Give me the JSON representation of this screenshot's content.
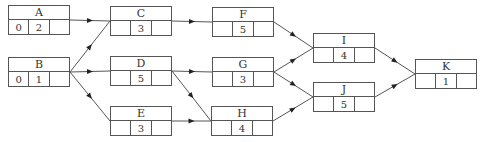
{
  "diagram": {
    "type": "activity-on-node network",
    "nodes": [
      {
        "id": "A",
        "x": 8,
        "y": 5,
        "es": "0",
        "duration": "2",
        "ef": ""
      },
      {
        "id": "B",
        "x": 8,
        "y": 57,
        "es": "0",
        "duration": "1",
        "ef": ""
      },
      {
        "id": "C",
        "x": 110,
        "y": 6,
        "es": "",
        "duration": "3",
        "ef": ""
      },
      {
        "id": "D",
        "x": 110,
        "y": 56,
        "es": "",
        "duration": "5",
        "ef": ""
      },
      {
        "id": "E",
        "x": 110,
        "y": 106,
        "es": "",
        "duration": "3",
        "ef": ""
      },
      {
        "id": "F",
        "x": 212,
        "y": 7,
        "es": "",
        "duration": "5",
        "ef": ""
      },
      {
        "id": "G",
        "x": 212,
        "y": 57,
        "es": "",
        "duration": "3",
        "ef": ""
      },
      {
        "id": "H",
        "x": 211,
        "y": 106,
        "es": "",
        "duration": "4",
        "ef": ""
      },
      {
        "id": "I",
        "x": 313,
        "y": 33,
        "es": "",
        "duration": "4",
        "ef": ""
      },
      {
        "id": "J",
        "x": 313,
        "y": 82,
        "es": "",
        "duration": "5",
        "ef": ""
      },
      {
        "id": "K",
        "x": 415,
        "y": 59,
        "es": "",
        "duration": "1",
        "ef": ""
      }
    ],
    "edges": [
      [
        "A",
        "C"
      ],
      [
        "B",
        "C"
      ],
      [
        "B",
        "D"
      ],
      [
        "B",
        "E"
      ],
      [
        "C",
        "F"
      ],
      [
        "D",
        "G"
      ],
      [
        "D",
        "H"
      ],
      [
        "E",
        "H"
      ],
      [
        "F",
        "I"
      ],
      [
        "G",
        "I"
      ],
      [
        "G",
        "J"
      ],
      [
        "H",
        "J"
      ],
      [
        "I",
        "K"
      ],
      [
        "J",
        "K"
      ]
    ],
    "node_width": 62,
    "node_height": 30,
    "line_color": "#555555"
  }
}
